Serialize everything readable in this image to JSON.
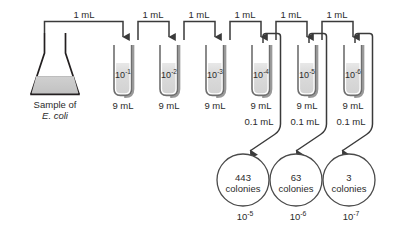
{
  "diagram": {
    "source_vessel": {
      "name": "erlenmeyer-flask",
      "label_line1": "Sample of",
      "label_line2": "E. coli",
      "fill_color": "#c9c9c9",
      "outline_color": "#231f20"
    },
    "transfer_labels": [
      "1 mL",
      "1 mL",
      "1 mL",
      "1 mL",
      "1 mL",
      "1 mL"
    ],
    "tubes": [
      {
        "dilution_base": "10",
        "dilution_exp": "-1",
        "volume": "9 mL",
        "aliquot": null
      },
      {
        "dilution_base": "10",
        "dilution_exp": "-2",
        "volume": "9 mL",
        "aliquot": null
      },
      {
        "dilution_base": "10",
        "dilution_exp": "-3",
        "volume": "9 mL",
        "aliquot": null
      },
      {
        "dilution_base": "10",
        "dilution_exp": "-4",
        "volume": "9 mL",
        "aliquot": "0.1 mL"
      },
      {
        "dilution_base": "10",
        "dilution_exp": "-5",
        "volume": "9 mL",
        "aliquot": "0.1 mL"
      },
      {
        "dilution_base": "10",
        "dilution_exp": "-6",
        "volume": "9 mL",
        "aliquot": "0.1 mL"
      }
    ],
    "plates": [
      {
        "count": "443",
        "unit": "colonies",
        "dilution_base": "10",
        "dilution_exp": "-5"
      },
      {
        "count": "63",
        "unit": "colonies",
        "dilution_base": "10",
        "dilution_exp": "-6"
      },
      {
        "count": "3",
        "unit": "colonies",
        "dilution_base": "10",
        "dilution_exp": "-7"
      }
    ],
    "colors": {
      "line": "#3a3a3a",
      "tube_outline": "#6e6e6e",
      "tube_fill": "#d8d8d8",
      "tube_shadow": "#9a9a9a",
      "plate_outline": "#4a4a4a",
      "text": "#2b2b2b",
      "background": "#ffffff"
    }
  }
}
